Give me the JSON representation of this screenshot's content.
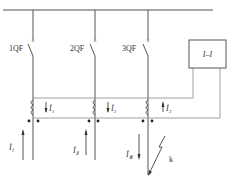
{
  "diagram": {
    "title": "",
    "breakers": [
      {
        "label": "1QF",
        "x": 33
      },
      {
        "label": "2QF",
        "x": 95
      },
      {
        "label": "3QF",
        "x": 148
      }
    ],
    "relay": {
      "label": "I–I"
    },
    "secondary_currents": [
      {
        "label": "İ",
        "sub": "1"
      },
      {
        "label": "İ",
        "sub": "2"
      },
      {
        "label": "İ",
        "sub": "3"
      }
    ],
    "line_currents": [
      {
        "label": "İ",
        "sub": "Ⅰ",
        "direction": "up"
      },
      {
        "label": "İ",
        "sub": "Ⅱ",
        "direction": "up"
      },
      {
        "label": "İ",
        "sub": "Ⅲ",
        "direction": "down"
      }
    ],
    "fault": {
      "label": "k"
    },
    "colors": {
      "line": "#555555",
      "background": "#ffffff"
    }
  }
}
